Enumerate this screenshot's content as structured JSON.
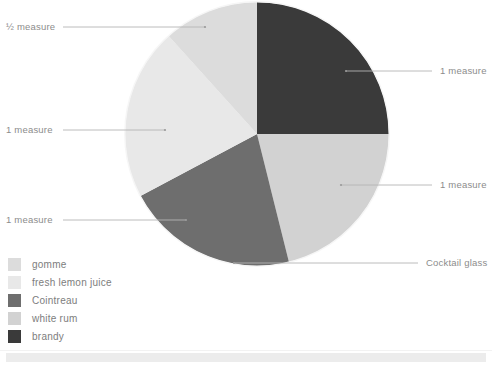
{
  "chart_data": {
    "type": "pie",
    "title": "",
    "subtitle": "",
    "xlabel": "",
    "ylabel": "",
    "legend_position": "bottom-left",
    "grid": false,
    "total_measures": 4.5,
    "categories": [
      "gomme",
      "fresh lemon juice",
      "Cointreau",
      "white rum",
      "brandy"
    ],
    "values": [
      0.5,
      1,
      1,
      1,
      1
    ],
    "value_labels": [
      "½ measure",
      "1 measure",
      "1 measure",
      "1 measure",
      "1 measure"
    ],
    "angles_deg": [
      42,
      76,
      76,
      76,
      90
    ],
    "colors": [
      "#dcdcdc",
      "#e8e8e8",
      "#6e6e6e",
      "#d2d2d2",
      "#3a3a3a"
    ],
    "slices": [
      {
        "name": "brandy",
        "label": "1 measure",
        "value": 1,
        "color": "#3a3a3a",
        "start_deg": 0,
        "end_deg": 90
      },
      {
        "name": "white rum",
        "label": "1 measure",
        "value": 1,
        "color": "#d2d2d2",
        "start_deg": 90,
        "end_deg": 166
      },
      {
        "name": "Cointreau",
        "label": "1 measure",
        "value": 1,
        "color": "#6e6e6e",
        "start_deg": 166,
        "end_deg": 242
      },
      {
        "name": "fresh lemon juice",
        "label": "1 measure",
        "value": 1,
        "color": "#e8e8e8",
        "start_deg": 242,
        "end_deg": 318
      },
      {
        "name": "gomme",
        "label": "½ measure",
        "value": 0.5,
        "color": "#dcdcdc",
        "start_deg": 318,
        "end_deg": 360
      }
    ],
    "annotations": [
      {
        "text": "½ measure",
        "target": "gomme"
      },
      {
        "text": "1 measure",
        "target": "fresh lemon juice"
      },
      {
        "text": "1 measure",
        "target": "Cointreau"
      },
      {
        "text": "1 measure",
        "target": "brandy"
      },
      {
        "text": "1 measure",
        "target": "white rum"
      },
      {
        "text": "Cocktail glass",
        "target": "pie-outline"
      }
    ]
  },
  "callouts": {
    "gomme": {
      "text": "½ measure"
    },
    "lemon": {
      "text": "1 measure"
    },
    "cointreau": {
      "text": "1 measure"
    },
    "brandy": {
      "text": "1 measure"
    },
    "white_rum": {
      "text": "1 measure"
    },
    "glass": {
      "text": "Cocktail glass"
    }
  },
  "legend": {
    "items": [
      {
        "label": "gomme",
        "color": "#dcdcdc"
      },
      {
        "label": "fresh lemon juice",
        "color": "#e8e8e8"
      },
      {
        "label": "Cointreau",
        "color": "#6e6e6e"
      },
      {
        "label": "white rum",
        "color": "#d2d2d2"
      },
      {
        "label": "brandy",
        "color": "#3a3a3a"
      }
    ]
  },
  "style": {
    "background": "#ffffff",
    "text_color": "#8c8c8c",
    "leader_line_color": "#b4b4b4",
    "pie_edge_color": "#f4f4f4",
    "footer_band_color": "#ececec"
  }
}
